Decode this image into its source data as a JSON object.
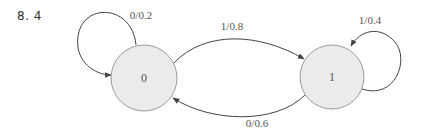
{
  "problem": {
    "number": "8. 4"
  },
  "diagram": {
    "type": "state-transition",
    "colors": {
      "node_fill": "#ebebeb",
      "node_stroke": "#9a9a9a",
      "edge": "#444444",
      "label": "#555555"
    },
    "nodes": [
      {
        "id": "0",
        "label": "0"
      },
      {
        "id": "1",
        "label": "1"
      }
    ],
    "edges": [
      {
        "from": "0",
        "to": "0",
        "label": "0/0.2"
      },
      {
        "from": "0",
        "to": "1",
        "label": "1/0.8"
      },
      {
        "from": "1",
        "to": "1",
        "label": "1/0.4"
      },
      {
        "from": "1",
        "to": "0",
        "label": "0/0.6"
      }
    ]
  }
}
